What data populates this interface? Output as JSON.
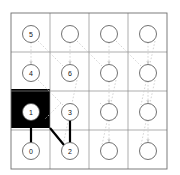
{
  "figure": {
    "kind": "grid-graph-diagram",
    "width": 180,
    "height": 175,
    "background_color": "#ffffff"
  },
  "grid": {
    "rows": 4,
    "cols": 4,
    "origin_x": 11,
    "origin_y": 13,
    "cell_size": 39,
    "line_color": "#8a8a8a",
    "line_width": 0.7,
    "border_color": "#6e6e6e",
    "border_width": 0.9
  },
  "style": {
    "node_radius": 8.5,
    "node_stroke": "#4d4d4d",
    "node_stroke_width": 0.8,
    "node_fill": "#ffffff",
    "label_color": "#111111",
    "label_size": 7,
    "blocked_cell_color": "#000000",
    "path_color": "#000000",
    "path_width": 2.2,
    "dotted_color": "#c9c9c9",
    "dotted_width": 0.8,
    "dotted_dash": "1.6,1.8"
  },
  "blocked_cells": [
    {
      "row": 2,
      "col": 0,
      "x": 11,
      "y": 89,
      "w": 39,
      "h": 39
    }
  ],
  "nodes": [
    {
      "id": "n-r0c0",
      "label": "5",
      "row": 0,
      "col": 0,
      "cx": 31,
      "cy": 34,
      "labeled": true
    },
    {
      "id": "n-r0c1",
      "label": "",
      "row": 0,
      "col": 1,
      "cx": 70,
      "cy": 34,
      "labeled": false
    },
    {
      "id": "n-r0c2",
      "label": "",
      "row": 0,
      "col": 2,
      "cx": 109,
      "cy": 34,
      "labeled": false
    },
    {
      "id": "n-r0c3",
      "label": "",
      "row": 0,
      "col": 3,
      "cx": 148,
      "cy": 34,
      "labeled": false
    },
    {
      "id": "n-r1c0",
      "label": "4",
      "row": 1,
      "col": 0,
      "cx": 31,
      "cy": 73,
      "labeled": true
    },
    {
      "id": "n-r1c1",
      "label": "6",
      "row": 1,
      "col": 1,
      "cx": 70,
      "cy": 73,
      "labeled": true
    },
    {
      "id": "n-r1c2",
      "label": "",
      "row": 1,
      "col": 2,
      "cx": 109,
      "cy": 73,
      "labeled": false
    },
    {
      "id": "n-r1c3",
      "label": "",
      "row": 1,
      "col": 3,
      "cx": 148,
      "cy": 73,
      "labeled": false
    },
    {
      "id": "n-r2c0",
      "label": "1",
      "row": 2,
      "col": 0,
      "cx": 31,
      "cy": 112,
      "labeled": true
    },
    {
      "id": "n-r2c1",
      "label": "3",
      "row": 2,
      "col": 1,
      "cx": 70,
      "cy": 112,
      "labeled": true
    },
    {
      "id": "n-r2c2",
      "label": "",
      "row": 2,
      "col": 2,
      "cx": 109,
      "cy": 112,
      "labeled": false
    },
    {
      "id": "n-r2c3",
      "label": "",
      "row": 2,
      "col": 3,
      "cx": 148,
      "cy": 112,
      "labeled": false
    },
    {
      "id": "n-r3c0",
      "label": "0",
      "row": 3,
      "col": 0,
      "cx": 31,
      "cy": 151,
      "labeled": true
    },
    {
      "id": "n-r3c1",
      "label": "2",
      "row": 3,
      "col": 1,
      "cx": 70,
      "cy": 151,
      "labeled": true
    },
    {
      "id": "n-r3c2",
      "label": "",
      "row": 3,
      "col": 2,
      "cx": 109,
      "cy": 151,
      "labeled": false
    },
    {
      "id": "n-r3c3",
      "label": "",
      "row": 3,
      "col": 3,
      "cx": 148,
      "cy": 151,
      "labeled": false
    }
  ],
  "path_edges": [
    {
      "id": "edge-1-0",
      "from": "1",
      "to": "0",
      "x1": 31,
      "y1": 120.5,
      "x2": 31,
      "y2": 142.5
    },
    {
      "id": "edge-1-2",
      "from": "1",
      "to": "2",
      "x1": 50,
      "y1": 128,
      "x2": 64,
      "y2": 145
    },
    {
      "id": "edge-3-2",
      "from": "3",
      "to": "2",
      "x1": 70,
      "y1": 120.5,
      "x2": 70,
      "y2": 142.5
    }
  ],
  "dotted_edges": [
    {
      "id": "dot-r0c0-r1c0",
      "x1": 31,
      "y1": 42.5,
      "x2": 31,
      "y2": 64.5,
      "arrow": true
    },
    {
      "id": "dot-r0c1-r1c1",
      "x1": 70,
      "y1": 42.5,
      "x2": 70,
      "y2": 64.5,
      "arrow": true
    },
    {
      "id": "dot-r0c2-r1c2",
      "x1": 109,
      "y1": 42.5,
      "x2": 109,
      "y2": 64.5,
      "arrow": true
    },
    {
      "id": "dot-r0c3-r1c3",
      "x1": 148,
      "y1": 42.5,
      "x2": 148,
      "y2": 64.5,
      "arrow": true
    },
    {
      "id": "dot-r1c2-r2c2",
      "x1": 109,
      "y1": 81.5,
      "x2": 109,
      "y2": 103.5,
      "arrow": true
    },
    {
      "id": "dot-r1c3-r2c3",
      "x1": 148,
      "y1": 81.5,
      "x2": 148,
      "y2": 103.5,
      "arrow": true
    },
    {
      "id": "dot-r2c2-r3c2",
      "x1": 109,
      "y1": 120.5,
      "x2": 109,
      "y2": 142.5,
      "arrow": true
    },
    {
      "id": "dot-r2c3-r3c3",
      "x1": 148,
      "y1": 120.5,
      "x2": 148,
      "y2": 142.5,
      "arrow": true
    },
    {
      "id": "dot-diag-a",
      "x1": 38,
      "y1": 41,
      "x2": 63,
      "y2": 66,
      "arrow": false
    },
    {
      "id": "dot-diag-b",
      "x1": 38,
      "y1": 80,
      "x2": 63,
      "y2": 105,
      "arrow": false
    },
    {
      "id": "dot-diag-c",
      "x1": 77,
      "y1": 41,
      "x2": 102,
      "y2": 66,
      "arrow": false
    },
    {
      "id": "dot-diag-d",
      "x1": 77,
      "y1": 80,
      "x2": 63,
      "y2": 145,
      "arrow": false
    },
    {
      "id": "dot-diag-e",
      "x1": 116,
      "y1": 41,
      "x2": 141,
      "y2": 66,
      "arrow": false
    },
    {
      "id": "dot-diag-f",
      "x1": 116,
      "y1": 80,
      "x2": 102,
      "y2": 145,
      "arrow": false
    },
    {
      "id": "dot-diag-g",
      "x1": 155,
      "y1": 41,
      "x2": 141,
      "y2": 105,
      "arrow": false
    },
    {
      "id": "dot-diag-h",
      "x1": 155,
      "y1": 80,
      "x2": 141,
      "y2": 145,
      "arrow": false
    },
    {
      "id": "dot-diag-i",
      "x1": 100,
      "y1": 103,
      "x2": 116,
      "y2": 119,
      "arrow": false
    },
    {
      "id": "dot-diag-j",
      "x1": 61,
      "y1": 103,
      "x2": 45,
      "y2": 119,
      "arrow": false
    }
  ]
}
